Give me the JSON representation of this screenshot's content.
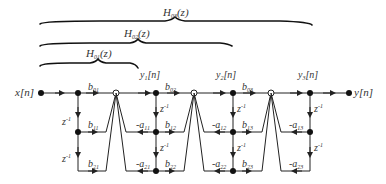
{
  "diagram": {
    "type": "cascade-form IIR signal-flow graph",
    "braces": [
      {
        "label": "H",
        "sub": "03",
        "arg": "(z)"
      },
      {
        "label": "H",
        "sub": "02",
        "arg": "(z)"
      },
      {
        "label": "H",
        "sub": "01",
        "arg": "(z)"
      }
    ],
    "input": {
      "label": "x[n]"
    },
    "output": {
      "label": "y[n]"
    },
    "intermediate": [
      {
        "y": "y",
        "sub": "1",
        "tail": "[n]"
      },
      {
        "y": "y",
        "sub": "2",
        "tail": "[n]"
      },
      {
        "y": "y",
        "sub": "3",
        "tail": "[n]"
      }
    ],
    "delay": {
      "z": "z",
      "exp": "-1"
    },
    "stages": [
      {
        "b0": "01",
        "b1": "11",
        "b2": "21"
      },
      {
        "b0": "02",
        "b1": "12",
        "b2": "22",
        "a1": "11",
        "a2": "21"
      },
      {
        "b0": "03",
        "b1": "13",
        "b2": "23",
        "a1": "12",
        "a2": "22"
      },
      {
        "a1": "13",
        "a2": "23"
      }
    ],
    "coef_b": "b",
    "coef_a": "-a"
  }
}
